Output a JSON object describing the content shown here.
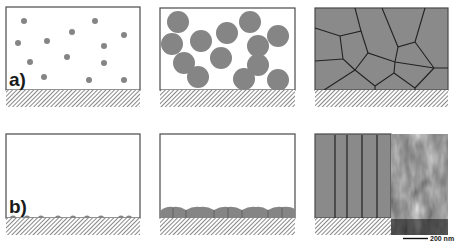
{
  "figure": {
    "rows": [
      {
        "label": "a)",
        "description": "Growth mode a: nucleation in volume, particle growth, grain structure",
        "panels": [
          {
            "name": "nuclei",
            "x": 6,
            "y": 7,
            "w": 134,
            "h": 83
          },
          {
            "name": "grown-particles",
            "x": 160,
            "y": 8,
            "w": 135,
            "h": 82
          },
          {
            "name": "polycrystalline-grains",
            "x": 315,
            "y": 8,
            "w": 133,
            "h": 82
          }
        ]
      },
      {
        "label": "b)",
        "description": "Growth mode b: surface nucleation, layer, columnar structure",
        "panels": [
          {
            "name": "surface-nuclei",
            "x": 6,
            "y": 134,
            "w": 134,
            "h": 84
          },
          {
            "name": "surface-layer",
            "x": 160,
            "y": 134,
            "w": 135,
            "h": 84
          },
          {
            "name": "columnar-grains-with-micrograph",
            "x": 315,
            "y": 134,
            "w": 133,
            "h": 84
          }
        ]
      }
    ],
    "scale_bar": {
      "text": "200 nm"
    },
    "colors": {
      "border": "#4a4a4a",
      "fill_grey": "#8a8a8a",
      "particle_grey": "#858585",
      "boundary": "#222222",
      "background": "#ffffff"
    }
  }
}
